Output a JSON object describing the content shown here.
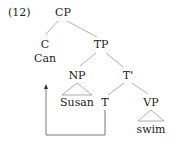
{
  "example_number": "(12)",
  "tree": {
    "CP": "CP",
    "C": "C",
    "C_word": "Can",
    "TP": "TP",
    "NP": "NP",
    "NP_word": "Susan",
    "T_bar": "T'",
    "T": "T",
    "VP": "VP",
    "VP_word": "swim"
  },
  "movement": {
    "from": "T",
    "to": "C",
    "type": "head-movement arrow"
  },
  "colors": {
    "text": "#222222",
    "edge": "#9a9a9a",
    "arrow": "#555555"
  }
}
